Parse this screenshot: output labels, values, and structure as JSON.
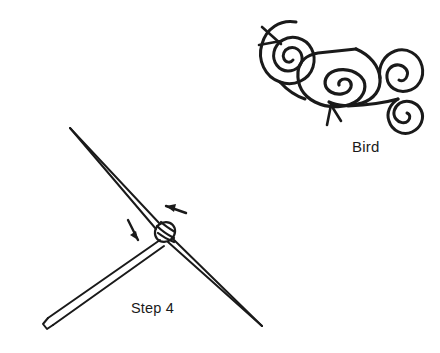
{
  "page": {
    "background_color": "#ffffff",
    "ink_color": "#1a1a1a",
    "width": 440,
    "height": 353
  },
  "figures": [
    {
      "id": "bird-motif",
      "name": "bird-spiral-motif",
      "caption": "Bird",
      "description": "Stylized bird rendered as connected spirals: round head spiral with beak, angular body spiral with legs, round wing spiral and round tail spiral",
      "parts": [
        "head-spiral",
        "beak-mark",
        "body-spiral",
        "legs-mark",
        "wing-spiral",
        "tail-spiral"
      ]
    },
    {
      "id": "step-4-diagram",
      "name": "crossed-sticks-diagram",
      "caption": "Step 4",
      "description": "Two crossed sticks lashed together at the center with a wrapped binding, with two direction arrows indicating wrapping motion",
      "parts": [
        "stick-long-diagonal",
        "stick-short-diagonal",
        "binding-knot",
        "arrow-left",
        "arrow-down"
      ]
    }
  ],
  "labels": {
    "bird": "Bird",
    "step": "Step 4"
  },
  "icons": {
    "arrow_left": "arrow-left-icon",
    "arrow_down": "arrow-down-icon"
  }
}
